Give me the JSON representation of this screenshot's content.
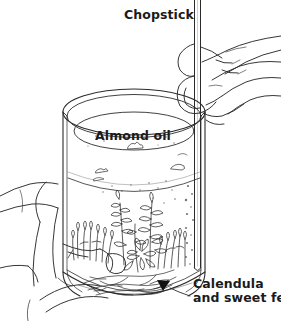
{
  "figure": {
    "background_color": "#ffffff",
    "ink_color": "#2b2b2b",
    "label_color": "#1b1b1b",
    "labels": {
      "chopstick": "Chopstick",
      "almond_oil": "Almond oil",
      "calendula_line1": "Calendula",
      "calendula_line2": "and sweet fern"
    },
    "parts": [
      "chopstick",
      "right-hand",
      "glass-jar",
      "oil-surface",
      "oil-bubbles",
      "herbs",
      "left-hand",
      "callout-arrow"
    ]
  }
}
